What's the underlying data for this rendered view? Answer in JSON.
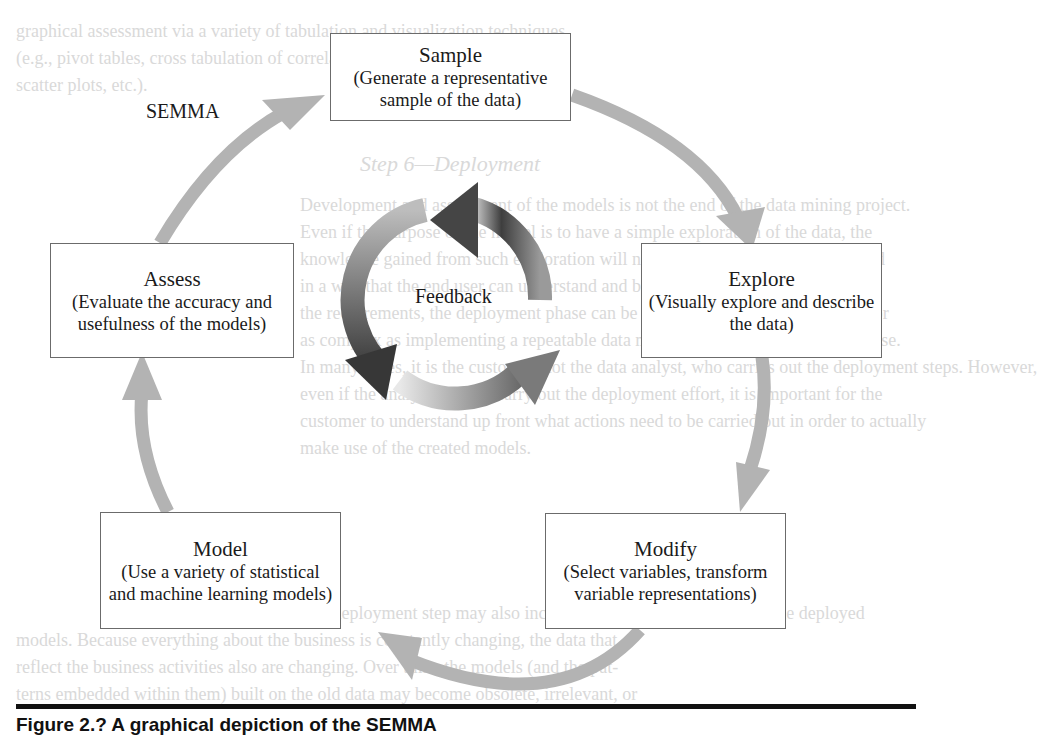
{
  "diagram": {
    "title_label": "SEMMA",
    "center_label": "Feedback",
    "steps": [
      {
        "id": "sample",
        "title": "Sample",
        "description": "(Generate a representative sample of the data)"
      },
      {
        "id": "explore",
        "title": "Explore",
        "description": "(Visually explore and describe the data)"
      },
      {
        "id": "modify",
        "title": "Modify",
        "description": "(Select variables, transform variable representations)"
      },
      {
        "id": "model",
        "title": "Model",
        "description": "(Use a variety of statistical and machine learning models)"
      },
      {
        "id": "assess",
        "title": "Assess",
        "description": "(Evaluate the accuracy and usefulness of the models)"
      }
    ],
    "flow": [
      "Sample",
      "Explore",
      "Modify",
      "Model",
      "Assess",
      "Sample"
    ],
    "colors": {
      "cycle_arrow": "#b3b3b3",
      "feedback_dark": "#3c3c3c",
      "feedback_light": "#e6e6e6",
      "box_border": "#6b6b6b",
      "rule": "#111111"
    }
  },
  "caption": {
    "text": "Figure 2.?   A graphical depiction of the SEMMA"
  },
  "background_text": {
    "lines": [
      "graphical assessment via a variety of tabulation and visualization techniques",
      "(e.g., pivot tables, cross tabulation of correlations, histograms, box plots,",
      "scatter plots, etc.).",
      "Step 6—Deployment",
      "Development and assessment of the models is not the end of the data mining project.",
      "Even if the purpose of the model is to have a simple exploration of the data, the",
      "knowledge gained from such exploration will need to be organized and presented",
      "in a way that the end user can understand and benefit from it. Depending on",
      "the requirements, the deployment phase can be as simple as generating a report or",
      "as complex as implementing a repeatable data mining process across the enterprise.",
      "In many cases, it is the customer, not the data analyst, who carries out the deployment steps. However,",
      "even if the analyst will not carry out the deployment effort, it is important for the",
      "customer to understand up front what actions need to be carried out in order to actually",
      "make use of the created models.",
      "The deployment step may also include maintenance activities for the deployed",
      "models. Because everything about the business is constantly changing, the data that",
      "reflect the business activities also are changing. Over time, the models (and the pat-",
      "terns embedded within them) built on the old data may become obsolete, irrelevant, or"
    ]
  }
}
